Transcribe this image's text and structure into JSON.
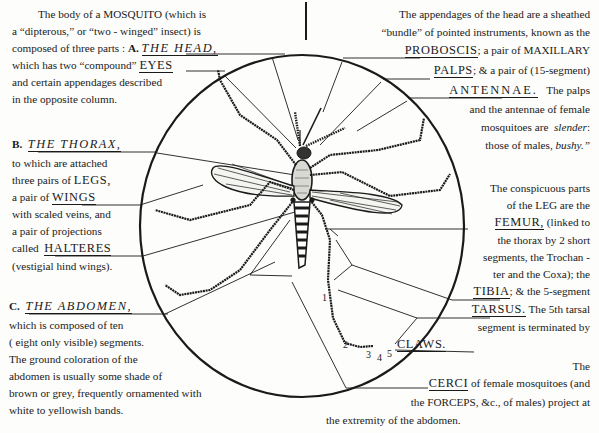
{
  "head_section": {
    "intro_lines": [
      "The body of a MOSQUITO (which is",
      "a “dipterous,”  or “two - winged” insect)  is",
      "composed of three parts :"
    ],
    "marker": "A.",
    "title": "THE HEAD,",
    "line4_prefix": "which has two “compound”",
    "eyes_label": "EYES",
    "line5": "and certain appendages described",
    "line6": "in the opposite column."
  },
  "appendages": {
    "line1": "The appendages of the head are a sheathed",
    "line2": "“bundle” of pointed instruments, known as the",
    "proboscis_label": "PROBOSCIS",
    "line3_suffix": "; a pair of MAXILLARY",
    "palps_label": "PALPS",
    "line4_suffix": "; & a pair of (15-segment)",
    "antennae_label": "ANTENNAE.",
    "line5_suffix": "The palps",
    "line6": "and the antennae of female",
    "line7_prefix": "mosquitoes are",
    "slender": "slender",
    "line7_suffix": ":",
    "line8_prefix": "those of males,",
    "bushy": "bushy.”"
  },
  "thorax_section": {
    "marker": "B.",
    "title": "THE THORAX,",
    "line1": "to which are attached",
    "line2_prefix": "three pairs of",
    "legs_label": "LEGS,",
    "line3_prefix": "a  pair  of",
    "wings_label": "WINGS",
    "line4": "with scaled veins, and",
    "line5": "a pair of projections",
    "line6_prefix": "called",
    "halteres_label": "HALTERES",
    "line7": "(vestigial hind wings)."
  },
  "leg_section": {
    "line1": "The conspicuous parts",
    "line2": "of the LEG are the",
    "femur_label": "FEMUR,",
    "line3_suffix": "(linked to",
    "line4": "the thorax by 2 short",
    "line5": "segments, the Trochan -",
    "line6": "ter and the Coxa); the",
    "tibia_label": "TIBIA",
    "line7_suffix": "; & the 5-segment",
    "tarsus_label": "TARSUS.",
    "line8_suffix": "The 5th tarsal",
    "line9": "segment is terminated by",
    "claws_label": "CLAWS."
  },
  "abdomen_section": {
    "marker": "C.",
    "title": "THE ABDOMEN,",
    "line1": "which is composed of ten",
    "line2": "( eight only visible) segments.",
    "line3": "The ground coloration of the",
    "line4": "abdomen is usually some shade of",
    "line5": "brown or grey, frequently ornamented with",
    "line6": "white to yellowish bands."
  },
  "cerci_section": {
    "line1": "The",
    "cerci_label": "CERCI",
    "line2_suffix": "of female mosquitoes (and",
    "line3": "the FORCEPS, &c., of males) project at",
    "line4": "the extremity of the abdomen."
  },
  "tarsal_numbers": [
    "1",
    "2",
    "3",
    "4",
    "5"
  ],
  "colors": {
    "ink": "#1a1a1a",
    "paper": "#fdfdfb"
  }
}
